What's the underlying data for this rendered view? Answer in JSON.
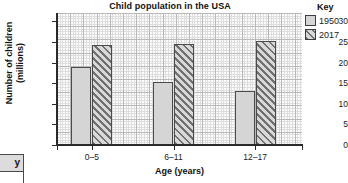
{
  "chart_data": {
    "type": "bar",
    "title": "Child population in the USA",
    "xlabel": "Age (years)",
    "ylabel_line1": "Number of children",
    "ylabel_line2": "(millions)",
    "categories": [
      "0–5",
      "6–11",
      "12–17"
    ],
    "series": [
      {
        "name": "1950",
        "values": [
          19,
          15.3,
          13
        ]
      },
      {
        "name": "2017",
        "values": [
          24.2,
          24.6,
          25.3
        ]
      }
    ],
    "ylim": [
      0,
      32
    ],
    "yticks": [
      0,
      5,
      10,
      15,
      20,
      25,
      30
    ],
    "ytick_labels": [
      "0",
      "5",
      "10",
      "15",
      "20",
      "25",
      "30"
    ],
    "grid": true,
    "legend_position": "right",
    "legend_title": "Key",
    "colors": {
      "series_1950": "#d5d5d5",
      "series_2017": "#9a9a9a",
      "bar_outline": "#4a4a4a",
      "axis": "#2a2a2a",
      "grid_major": "#b9b9b9",
      "grid_minor": "#dedede",
      "plot_background": "#fdfdfd"
    }
  },
  "legend": {
    "title": "Key",
    "entries": [
      {
        "label": "1950",
        "swatch": "solid-light-gray-swatch"
      },
      {
        "label": "2017",
        "swatch": "diagonal-hatch-swatch"
      }
    ]
  },
  "corner_widget": {
    "label": "y"
  }
}
